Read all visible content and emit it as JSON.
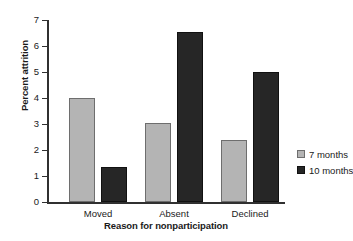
{
  "chart_data": {
    "type": "bar",
    "title": "",
    "xlabel": "Reason for nonparticipation",
    "ylabel": "Percent attrition",
    "categories": [
      "Moved",
      "Absent",
      "Declined"
    ],
    "series": [
      {
        "name": "7 months",
        "color": "#b4b4b4",
        "values": [
          4.0,
          3.05,
          2.4
        ]
      },
      {
        "name": "10 months",
        "color": "#262626",
        "values": [
          1.35,
          6.55,
          5.0
        ]
      }
    ],
    "ylim": [
      0,
      7
    ],
    "yticks": [
      0,
      1,
      2,
      3,
      4,
      5,
      6,
      7
    ],
    "yticklabels": [
      "0",
      "1",
      "2",
      "3",
      "4",
      "5",
      "6",
      "7"
    ],
    "grid": false,
    "legend_position": "right"
  },
  "axes": {
    "y_title": "Percent attrition",
    "x_title": "Reason for nonparticipation"
  },
  "legend": {
    "items": [
      {
        "label": "7 months",
        "swatch": "gray"
      },
      {
        "label": "10 months",
        "swatch": "black"
      }
    ]
  }
}
